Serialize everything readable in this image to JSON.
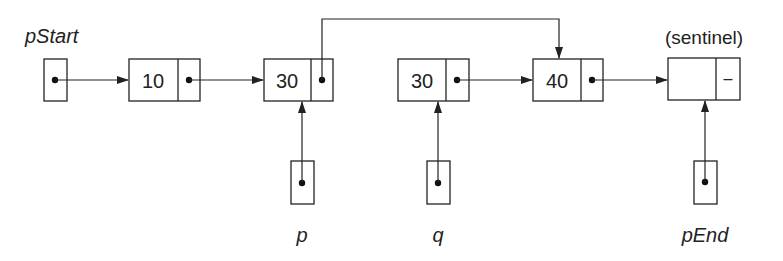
{
  "diagram": {
    "labels": {
      "pStart": "pStart",
      "p": "p",
      "q": "q",
      "pEnd": "pEnd",
      "sentinel": "(sentinel)"
    },
    "nodes": [
      {
        "id": "n1",
        "value": "10",
        "next": "n2"
      },
      {
        "id": "n2",
        "value": "30",
        "next": "n4"
      },
      {
        "id": "n3",
        "value": "30",
        "next": "n4"
      },
      {
        "id": "n4",
        "value": "40",
        "next": "sentinel"
      },
      {
        "id": "sentinel",
        "value": "",
        "next_symbol": "–"
      }
    ],
    "pointers": [
      {
        "name": "pStart",
        "target": "n1"
      },
      {
        "name": "p",
        "target": "n2"
      },
      {
        "name": "q",
        "target": "n3"
      },
      {
        "name": "pEnd",
        "target": "sentinel"
      }
    ],
    "colors": {
      "stroke": "#222222",
      "background": "#ffffff"
    }
  }
}
